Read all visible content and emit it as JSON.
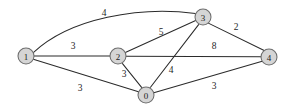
{
  "figure": {
    "width": 290,
    "height": 112,
    "background_color": "#ffffff"
  },
  "style": {
    "node_fill": "#d5d5d5",
    "node_stroke": "#6d6d6d",
    "edge_color": "#2b2b2b",
    "text_color": "#1a1a1a",
    "node_radius": 8
  },
  "nodes": [
    {
      "id": "n1",
      "label": "1",
      "x": 26,
      "y": 56
    },
    {
      "id": "n2",
      "label": "2",
      "x": 118,
      "y": 56
    },
    {
      "id": "n0",
      "label": "0",
      "x": 146,
      "y": 95
    },
    {
      "id": "n3",
      "label": "3",
      "x": 203,
      "y": 17
    },
    {
      "id": "n4",
      "label": "4",
      "x": 269,
      "y": 57
    }
  ],
  "edges": [
    {
      "id": "e13",
      "from": "1",
      "to": "3",
      "weight": "4",
      "label_x": 104,
      "label_y": 13,
      "curved": true
    },
    {
      "id": "e12",
      "from": "1",
      "to": "2",
      "weight": "3",
      "label_x": 73,
      "label_y": 46,
      "curved": false
    },
    {
      "id": "e10",
      "from": "1",
      "to": "0",
      "weight": "3",
      "label_x": 80,
      "label_y": 88,
      "curved": false
    },
    {
      "id": "e23",
      "from": "2",
      "to": "3",
      "weight": "5",
      "label_x": 161,
      "label_y": 32,
      "curved": false
    },
    {
      "id": "e24",
      "from": "2",
      "to": "4",
      "weight": "8",
      "label_x": 214,
      "label_y": 46,
      "curved": false
    },
    {
      "id": "e20",
      "from": "2",
      "to": "0",
      "weight": "3",
      "label_x": 124,
      "label_y": 74,
      "curved": false
    },
    {
      "id": "e03",
      "from": "0",
      "to": "3",
      "weight": "4",
      "label_x": 171,
      "label_y": 70,
      "curved": false
    },
    {
      "id": "e04",
      "from": "0",
      "to": "4",
      "weight": "3",
      "label_x": 214,
      "label_y": 86,
      "curved": false
    },
    {
      "id": "e34",
      "from": "3",
      "to": "4",
      "weight": "2",
      "label_x": 236,
      "label_y": 27,
      "curved": false
    }
  ]
}
